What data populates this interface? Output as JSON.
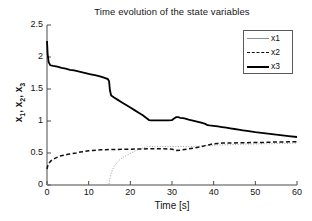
{
  "chart_data": {
    "type": "line",
    "title": "Time evolution of the state variables",
    "xlabel": "Time [s]",
    "ylabel": "x_1, x_2, x_3",
    "ylabel_parts": [
      "x",
      "1",
      ", x",
      "2",
      ", x",
      "3"
    ],
    "xlim": [
      0,
      60
    ],
    "ylim": [
      0,
      2.5
    ],
    "xticks": [
      0,
      10,
      20,
      30,
      40,
      50,
      60
    ],
    "xtick_labels": [
      "0",
      "10",
      "20",
      "30",
      "40",
      "50",
      "60"
    ],
    "yticks": [
      0,
      0.5,
      1,
      1.5,
      2,
      2.5
    ],
    "ytick_labels": [
      "0",
      "0.5",
      "1",
      "1.5",
      "2",
      "2.5"
    ],
    "grid": false,
    "legend_position": "upper right",
    "legend": [
      "x1",
      "x2",
      "x3"
    ],
    "series": [
      {
        "name": "x1",
        "style": "dotted",
        "color": "#9a9a9a",
        "x": [
          0,
          14.6,
          14.9,
          15.1,
          15.4,
          15.8,
          16.2,
          16.7,
          17.2,
          17.8,
          18.4,
          19.0,
          19.6,
          20.2,
          20.8,
          21.4,
          22.0,
          22.6,
          23.2,
          23.8,
          24.3,
          25.0,
          26.0,
          28.0,
          30.0,
          32.0,
          34.0,
          35.5,
          36.5,
          37.5,
          38.5,
          39.5,
          40.5,
          42.0,
          44.0,
          46.0,
          48.0,
          50.0,
          52.0,
          54.0,
          56.0,
          58.0,
          60.0
        ],
        "y": [
          0,
          0,
          0.02,
          0.1,
          0.18,
          0.25,
          0.3,
          0.34,
          0.38,
          0.41,
          0.44,
          0.46,
          0.48,
          0.5,
          0.52,
          0.54,
          0.555,
          0.57,
          0.585,
          0.595,
          0.6,
          0.6,
          0.6,
          0.6,
          0.6,
          0.6,
          0.6,
          0.6,
          0.605,
          0.61,
          0.615,
          0.62,
          0.625,
          0.625,
          0.63,
          0.635,
          0.64,
          0.64,
          0.645,
          0.645,
          0.65,
          0.65,
          0.655
        ]
      },
      {
        "name": "x2",
        "style": "dashed",
        "color": "#101010",
        "x": [
          0,
          0.3,
          1.0,
          2.0,
          3.0,
          4.0,
          5.0,
          6.0,
          7.0,
          8.0,
          9.0,
          10.0,
          11.0,
          12.0,
          13.0,
          14.0,
          15.0,
          16.0,
          18.0,
          20.0,
          22.0,
          24.0,
          25.0,
          26.0,
          27.0,
          28.0,
          29.0,
          30.0,
          30.6,
          31.0,
          32.0,
          33.0,
          34.0,
          35.0,
          36.0,
          37.0,
          38.0,
          39.0,
          40.0,
          41.0,
          42.0,
          44.0,
          46.0,
          48.0,
          50.0,
          52.0,
          54.0,
          56.0,
          58.0,
          60.0
        ],
        "y": [
          0.25,
          0.33,
          0.38,
          0.42,
          0.45,
          0.465,
          0.48,
          0.49,
          0.5,
          0.515,
          0.525,
          0.535,
          0.54,
          0.545,
          0.55,
          0.552,
          0.555,
          0.555,
          0.558,
          0.56,
          0.562,
          0.565,
          0.565,
          0.565,
          0.565,
          0.565,
          0.563,
          0.56,
          0.545,
          0.54,
          0.545,
          0.555,
          0.565,
          0.575,
          0.585,
          0.6,
          0.615,
          0.63,
          0.645,
          0.65,
          0.655,
          0.655,
          0.66,
          0.66,
          0.665,
          0.665,
          0.67,
          0.67,
          0.675,
          0.675
        ]
      },
      {
        "name": "x3",
        "style": "solid",
        "color": "#000000",
        "x": [
          0,
          0.15,
          0.4,
          0.8,
          1.5,
          2.5,
          3.5,
          4.5,
          5.5,
          6.5,
          7.5,
          8.5,
          9.5,
          10.5,
          11.5,
          12.5,
          13.5,
          14.6,
          14.9,
          15.1,
          15.4,
          16.0,
          17.0,
          18.0,
          19.0,
          20.0,
          21.0,
          22.0,
          23.0,
          24.0,
          24.5,
          25.0,
          26.0,
          27.0,
          28.0,
          29.0,
          30.0,
          30.5,
          31.0,
          31.5,
          32.0,
          33.0,
          34.0,
          35.0,
          36.0,
          37.0,
          38.0,
          38.5,
          39.0,
          40.0,
          41.0,
          42.0,
          43.0,
          44.0,
          45.0,
          46.0,
          47.0,
          48.0,
          50.0,
          52.0,
          54.0,
          56.0,
          58.0,
          60.0
        ],
        "y": [
          2.25,
          2.05,
          1.92,
          1.87,
          1.86,
          1.85,
          1.83,
          1.82,
          1.8,
          1.79,
          1.775,
          1.76,
          1.745,
          1.73,
          1.715,
          1.7,
          1.68,
          1.655,
          1.62,
          1.48,
          1.4,
          1.37,
          1.33,
          1.29,
          1.25,
          1.21,
          1.17,
          1.13,
          1.09,
          1.04,
          1.015,
          1.01,
          1.01,
          1.01,
          1.01,
          1.01,
          1.015,
          1.04,
          1.06,
          1.06,
          1.05,
          1.04,
          1.02,
          1.005,
          0.99,
          0.975,
          0.955,
          0.935,
          0.93,
          0.925,
          0.915,
          0.905,
          0.895,
          0.885,
          0.875,
          0.865,
          0.855,
          0.845,
          0.825,
          0.81,
          0.795,
          0.78,
          0.765,
          0.75
        ]
      }
    ]
  }
}
